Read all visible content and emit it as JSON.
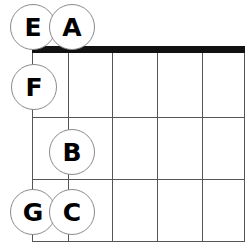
{
  "diagram": {
    "type": "guitar-fretboard-note-chart",
    "title": "",
    "colors": {
      "background": "#ffffff",
      "nut": "#111111",
      "grid_line": "#555555",
      "marker_fill": "#ffffff",
      "marker_border": "#8a8a8a",
      "letter": "#000000"
    },
    "fretboard": {
      "strings": 6,
      "frets": 3,
      "nut_label": "nut",
      "string_x": [
        0,
        36,
        80,
        125,
        170,
        212
      ],
      "fret_y": [
        7,
        71,
        133,
        195
      ]
    },
    "notes": [
      {
        "label": "E",
        "cx": 33,
        "cy": 27,
        "string_index": 0,
        "fret_index": 0
      },
      {
        "label": "A",
        "cx": 72,
        "cy": 27,
        "string_index": 1,
        "fret_index": 0
      },
      {
        "label": "F",
        "cx": 34,
        "cy": 87,
        "string_index": 0,
        "fret_index": 1
      },
      {
        "label": "B",
        "cx": 72,
        "cy": 152,
        "string_index": 1,
        "fret_index": 2
      },
      {
        "label": "G",
        "cx": 33,
        "cy": 212,
        "string_index": 0,
        "fret_index": 3
      },
      {
        "label": "C",
        "cx": 72,
        "cy": 212,
        "string_index": 1,
        "fret_index": 3
      }
    ]
  }
}
